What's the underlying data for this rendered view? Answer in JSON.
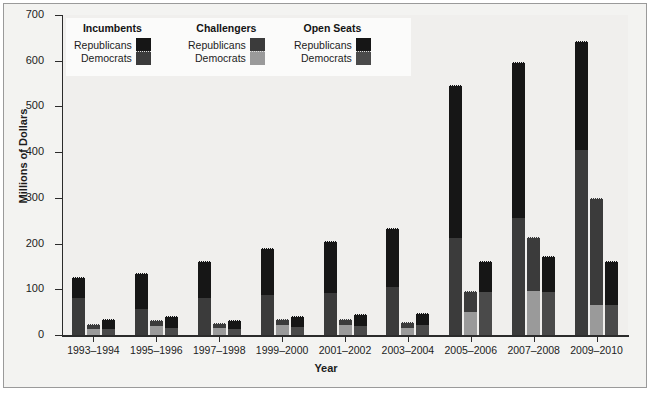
{
  "chart_data": {
    "type": "bar",
    "subtype": "grouped-stacked",
    "title": "",
    "xlabel": "Year",
    "ylabel": "Millions of Dollars",
    "ylim": [
      0,
      700
    ],
    "yticks": [
      0,
      100,
      200,
      300,
      400,
      500,
      600,
      700
    ],
    "grid": false,
    "legend_position": "top-left-inside",
    "categories": [
      "1993–1994",
      "1995–1996",
      "1997–1998",
      "1999–2000",
      "2001–2002",
      "2003–2004",
      "2005–2006",
      "2007–2008",
      "2009–2010"
    ],
    "groups": [
      {
        "name": "Incumbents",
        "stack": [
          {
            "name": "Democrats",
            "values": [
              82,
              58,
              80,
              88,
              93,
              105,
              213,
              257,
              405
            ]
          },
          {
            "name": "Republicans",
            "values": [
              43,
              75,
              80,
              100,
              110,
              127,
              331,
              337,
              237
            ]
          }
        ],
        "totals": [
          125,
          133,
          160,
          188,
          203,
          232,
          544,
          594,
          642
        ]
      },
      {
        "name": "Challengers",
        "stack": [
          {
            "name": "Democrats",
            "values": [
              14,
              20,
              15,
              22,
              22,
              15,
              50,
              97,
              65
            ]
          },
          {
            "name": "Republicans",
            "values": [
              8,
              11,
              9,
              10,
              11,
              11,
              45,
              116,
              232
            ]
          }
        ],
        "totals": [
          22,
          31,
          24,
          32,
          33,
          26,
          95,
          213,
          297
        ]
      },
      {
        "name": "Open Seats",
        "stack": [
          {
            "name": "Democrats",
            "values": [
              13,
              16,
              14,
              17,
              20,
              21,
              95,
              95,
              65
            ]
          },
          {
            "name": "Republicans",
            "values": [
              20,
              23,
              16,
              22,
              23,
              24,
              64,
              76,
              95
            ]
          }
        ],
        "totals": [
          33,
          39,
          30,
          39,
          43,
          45,
          159,
          171,
          160
        ]
      }
    ],
    "colors": {
      "incumbent_republican": "#161616",
      "incumbent_democrat": "#3b3b3b",
      "challenger_republican": "#3b3b3b",
      "challenger_democrat": "#9a9a9a",
      "open_republican": "#161616",
      "open_democrat": "#4a4a4a",
      "axis": "#2b2b2b",
      "panel_background": "#f0efed",
      "figure_background": "#f3f3f1",
      "legend_background": "#fbfbfa"
    }
  },
  "legend": {
    "columns": [
      {
        "header": "Incumbents",
        "rows": [
          {
            "label": "Republicans",
            "color": "#161616"
          },
          {
            "label": "Democrats",
            "color": "#3b3b3b"
          }
        ]
      },
      {
        "header": "Challengers",
        "rows": [
          {
            "label": "Republicans",
            "color": "#3b3b3b"
          },
          {
            "label": "Democrats",
            "color": "#9a9a9a"
          }
        ]
      },
      {
        "header": "Open Seats",
        "rows": [
          {
            "label": "Republicans",
            "color": "#161616"
          },
          {
            "label": "Democrats",
            "color": "#4a4a4a"
          }
        ]
      }
    ]
  },
  "axes": {
    "y_title": "Millions of Dollars",
    "x_title": "Year",
    "y_tick_labels": [
      "0",
      "100",
      "200",
      "300",
      "400",
      "500",
      "600",
      "700"
    ],
    "x_tick_labels": [
      "1993–1994",
      "1995–1996",
      "1997–1998",
      "1999–2000",
      "2001–2002",
      "2003–2004",
      "2005–2006",
      "2007–2008",
      "2009–2010"
    ]
  }
}
